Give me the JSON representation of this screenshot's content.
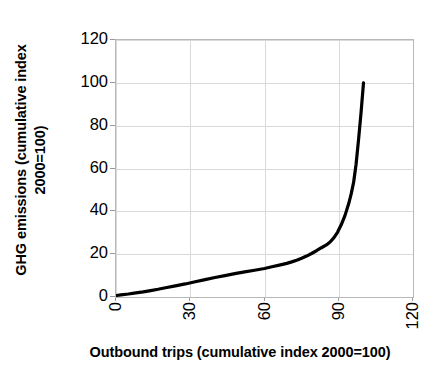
{
  "chart_data": {
    "type": "line",
    "title": "",
    "xlabel": "Outbound trips (cumulative index 2000=100)",
    "ylabel_line1": "GHG emissions (cumulative index",
    "ylabel_line2": "2000=100)",
    "ylabel": "GHG emissions (cumulative index 2000=100)",
    "xlim": [
      0,
      120
    ],
    "ylim": [
      0,
      120
    ],
    "xticks": [
      0,
      30,
      60,
      90,
      120
    ],
    "yticks": [
      0,
      20,
      40,
      60,
      80,
      100,
      120
    ],
    "xticklabels": [
      "0",
      "30",
      "60",
      "90",
      "120"
    ],
    "yticklabels": [
      "0",
      "20",
      "40",
      "60",
      "80",
      "100",
      "120"
    ],
    "xtick_rotation": 90,
    "ytick_rotation": 0,
    "grid": true,
    "legend": false,
    "line_color": "#000000",
    "line_width": 3.2,
    "grid_color": "#d9d9d9",
    "border_color": "#b8b8b8",
    "background": "#ffffff",
    "series": [
      {
        "name": "Cumulative GHG emissions vs outbound trips",
        "x": [
          0,
          2,
          5,
          8,
          11,
          14,
          17,
          20,
          24,
          28,
          32,
          36,
          40,
          44,
          48,
          52,
          56,
          60,
          63,
          66,
          69,
          71,
          73,
          75,
          77,
          79,
          81,
          83,
          85,
          86.5,
          88,
          89.5,
          91,
          92.5,
          94,
          95,
          96,
          97,
          98,
          99,
          100
        ],
        "y": [
          0.7,
          1.0,
          1.4,
          1.9,
          2.4,
          3.0,
          3.6,
          4.3,
          5.2,
          6.1,
          7.1,
          8.1,
          9.1,
          10.0,
          10.9,
          11.7,
          12.5,
          13.3,
          14.1,
          14.9,
          15.7,
          16.4,
          17.2,
          18.1,
          19.1,
          20.3,
          21.6,
          23.0,
          24.3,
          25.7,
          27.6,
          30.2,
          33.7,
          38.0,
          43.5,
          48.0,
          53.5,
          62.0,
          73.5,
          86.0,
          100.0
        ]
      }
    ]
  }
}
